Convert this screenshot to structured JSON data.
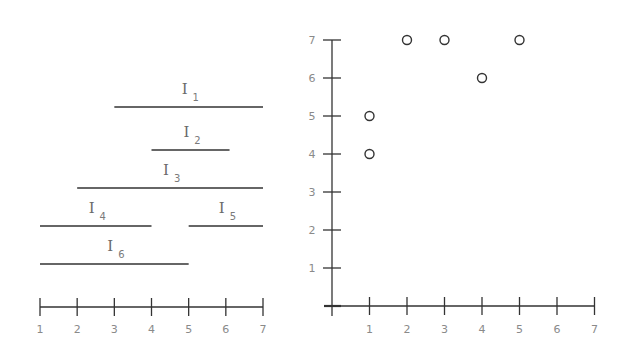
{
  "chart_data": [
    {
      "type": "interval-diagram",
      "title": "",
      "axis": {
        "min": 1,
        "max": 7,
        "ticks": [
          1,
          2,
          3,
          4,
          5,
          6,
          7
        ],
        "tick_labels": [
          "1",
          "2",
          "3",
          "4",
          "5",
          "6",
          "7"
        ]
      },
      "intervals": [
        {
          "name": "I",
          "sub": "1",
          "start": 3,
          "end": 7,
          "row": 0
        },
        {
          "name": "I",
          "sub": "2",
          "start": 4,
          "end": 6.1,
          "row": 1
        },
        {
          "name": "I",
          "sub": "3",
          "start": 2,
          "end": 7,
          "row": 2
        },
        {
          "name": "I",
          "sub": "4",
          "start": 1,
          "end": 4,
          "row": 3
        },
        {
          "name": "I",
          "sub": "5",
          "start": 5,
          "end": 7,
          "row": 3
        },
        {
          "name": "I",
          "sub": "6",
          "start": 1,
          "end": 5,
          "row": 4
        }
      ]
    },
    {
      "type": "scatter",
      "title": "",
      "xlabel": "",
      "ylabel": "",
      "xlim": [
        0,
        7
      ],
      "ylim": [
        0,
        7
      ],
      "x_ticks": [
        1,
        2,
        3,
        4,
        5,
        6,
        7
      ],
      "y_ticks": [
        1,
        2,
        3,
        4,
        5,
        6,
        7
      ],
      "x_tick_labels": [
        "1",
        "2",
        "3",
        "4",
        "5",
        "6",
        "7"
      ],
      "y_tick_labels": [
        "1",
        "2",
        "3",
        "4",
        "5",
        "6",
        "7"
      ],
      "grid": false,
      "marker": "open-circle",
      "points": [
        {
          "x": 1,
          "y": 5
        },
        {
          "x": 1,
          "y": 4
        },
        {
          "x": 2,
          "y": 7
        },
        {
          "x": 3,
          "y": 7
        },
        {
          "x": 4,
          "y": 6
        },
        {
          "x": 5,
          "y": 7
        }
      ]
    }
  ],
  "colors": {
    "line": "#333333",
    "label": "#8a8a8a",
    "marker": "#333333"
  }
}
